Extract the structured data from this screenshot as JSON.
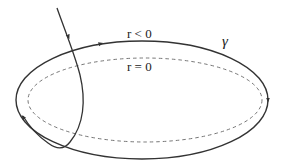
{
  "diagram": {
    "labels": {
      "outer_region": "r < 0",
      "inner_region": "r = 0",
      "curve_name": "γ"
    },
    "colors": {
      "stroke": "#333333",
      "dashed": "#777777",
      "background": "#ffffff"
    },
    "elements": [
      {
        "name": "closed-curve-gamma",
        "style": "solid",
        "arrows": [
          "top",
          "right"
        ]
      },
      {
        "name": "boundary-r-zero",
        "style": "dashed"
      },
      {
        "name": "incoming-path",
        "style": "solid",
        "arrows": [
          "descending",
          "lower-left"
        ]
      }
    ]
  }
}
